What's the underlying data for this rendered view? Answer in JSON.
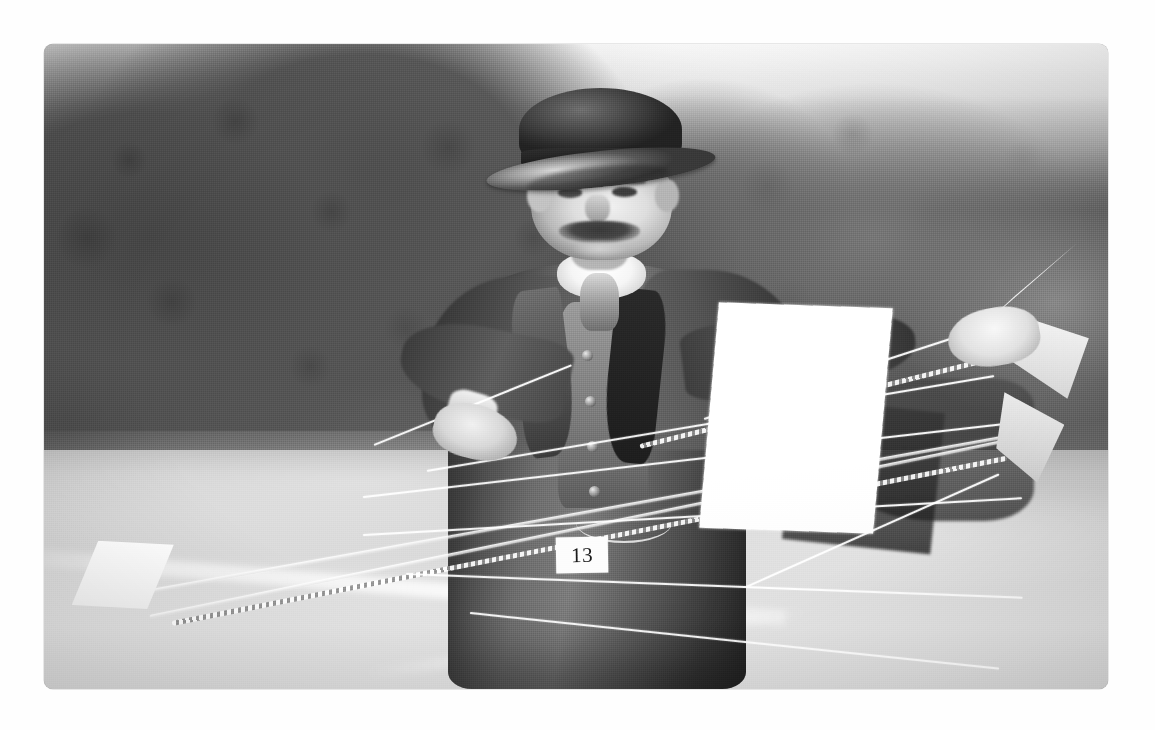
{
  "page": {
    "background_color": "#ffffff",
    "media_type": "photograph"
  },
  "photograph": {
    "caption_text": "",
    "era": "Edwardian",
    "tone": "black-and-white",
    "frame": {
      "left": 44,
      "top": 44,
      "width": 1064,
      "height": 645,
      "corner_radius": "9px",
      "border_color": "#c8c8c8"
    },
    "markings": {
      "number_label": "13"
    },
    "subject": {
      "person": "man-with-bowler-hat",
      "object": "model-aeroplane",
      "setting": "park-field-with-trees"
    },
    "palette": {
      "sky": "#fafafa",
      "foliage_dark": "#4a4a4a",
      "foliage_mid": "#5d5d5d",
      "grass_light": "#dcdcdc",
      "highlight_white": "#ffffff",
      "suit_dark": "#3a3a3a",
      "skin_light": "#e0e0e0",
      "hat_black": "#2e2e2e",
      "label_ink": "#1c1c1c"
    }
  }
}
